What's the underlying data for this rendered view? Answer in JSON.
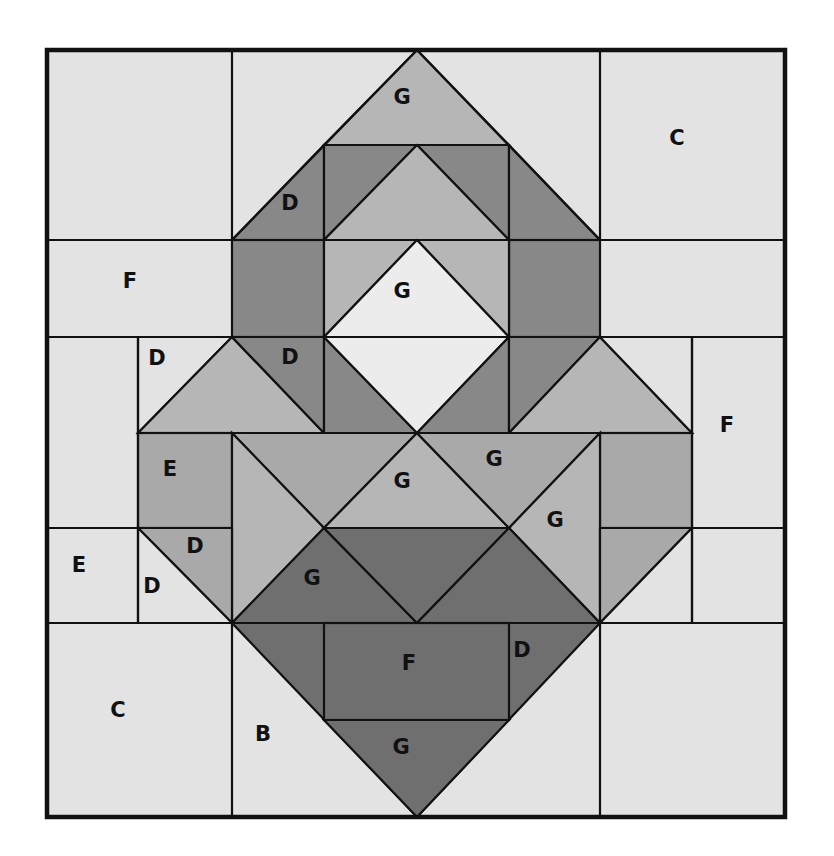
{
  "diagram": {
    "type": "quilt-block-piecing-diagram",
    "colors": {
      "background": "#e3e3e3",
      "very_light": "#ececec",
      "medium_light": "#b6b6b6",
      "medium": "#a9a9a9",
      "medium_dark": "#888888",
      "dark": "#6f6f6f",
      "seam": "#111111"
    },
    "template_letters": [
      "B",
      "C",
      "D",
      "E",
      "F",
      "G"
    ],
    "labels": [
      {
        "id": "g-top",
        "text": "G",
        "x": 402,
        "y": 97
      },
      {
        "id": "c-top-right",
        "text": "C",
        "x": 677,
        "y": 138
      },
      {
        "id": "d-upper-left",
        "text": "D",
        "x": 290,
        "y": 203
      },
      {
        "id": "f-left",
        "text": "F",
        "x": 130,
        "y": 281
      },
      {
        "id": "g-center-diamond",
        "text": "G",
        "x": 402,
        "y": 291
      },
      {
        "id": "d-left-small",
        "text": "D",
        "x": 157,
        "y": 358
      },
      {
        "id": "d-left-inner",
        "text": "D",
        "x": 290,
        "y": 357
      },
      {
        "id": "f-right",
        "text": "F",
        "x": 727,
        "y": 425
      },
      {
        "id": "e-left",
        "text": "E",
        "x": 170,
        "y": 469
      },
      {
        "id": "g-mid-center",
        "text": "G",
        "x": 402,
        "y": 481
      },
      {
        "id": "g-mid-right",
        "text": "G",
        "x": 494,
        "y": 459
      },
      {
        "id": "g-right-side",
        "text": "G",
        "x": 555,
        "y": 520
      },
      {
        "id": "d-left-lower-1",
        "text": "D",
        "x": 195,
        "y": 546
      },
      {
        "id": "e-far-left",
        "text": "E",
        "x": 79,
        "y": 565
      },
      {
        "id": "d-left-lower-2",
        "text": "D",
        "x": 152,
        "y": 586
      },
      {
        "id": "g-lower-left",
        "text": "G",
        "x": 312,
        "y": 578
      },
      {
        "id": "f-bottom-center",
        "text": "F",
        "x": 409,
        "y": 663
      },
      {
        "id": "d-bottom-right",
        "text": "D",
        "x": 522,
        "y": 650
      },
      {
        "id": "c-bottom-left",
        "text": "C",
        "x": 118,
        "y": 710
      },
      {
        "id": "b-bottom",
        "text": "B",
        "x": 263,
        "y": 734
      },
      {
        "id": "g-bottom",
        "text": "G",
        "x": 401,
        "y": 747
      }
    ]
  }
}
